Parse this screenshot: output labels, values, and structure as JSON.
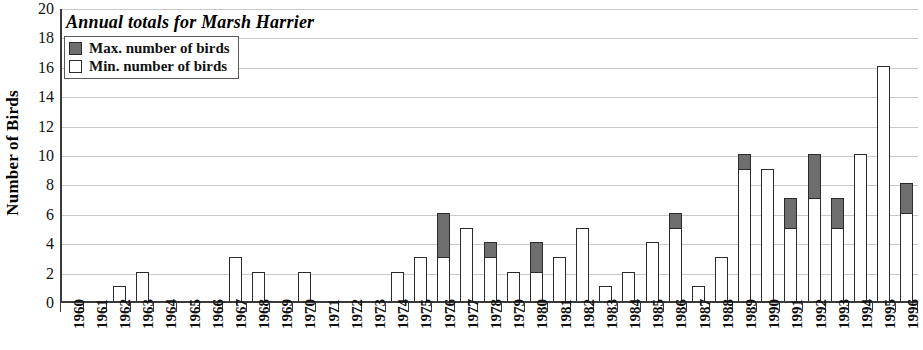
{
  "chart_data": {
    "type": "bar",
    "title": "Annual totals for Marsh Harrier",
    "xlabel": "",
    "ylabel": "Number of Birds",
    "ylim": [
      0,
      20
    ],
    "ytick_step": 2,
    "yticks": [
      20,
      18,
      16,
      14,
      12,
      10,
      8,
      6,
      4,
      2,
      0
    ],
    "grid": true,
    "stacked": true,
    "legend_position": "top-left",
    "legend": [
      {
        "label": "Max. number of birds",
        "color": "#6e6e6e"
      },
      {
        "label": "Min. number of birds",
        "color": "#ffffff"
      }
    ],
    "categories": [
      "1960",
      "1961",
      "1962",
      "1963",
      "1964",
      "1965",
      "1966",
      "1967",
      "1968",
      "1969",
      "1970",
      "1971",
      "1972",
      "1973",
      "1974",
      "1975",
      "1976",
      "1977",
      "1978",
      "1979",
      "1980",
      "1981",
      "1982",
      "1983",
      "1984",
      "1985",
      "1986",
      "1987",
      "1988",
      "1989",
      "1990",
      "1991",
      "1992",
      "1993",
      "1994",
      "1995",
      "1996"
    ],
    "series": [
      {
        "name": "Min. number of birds",
        "color": "#ffffff",
        "values": [
          0,
          0,
          1,
          2,
          0,
          0,
          0,
          3,
          2,
          0,
          2,
          0,
          0,
          0,
          2,
          3,
          3,
          5,
          3,
          2,
          2,
          3,
          5,
          1,
          2,
          4,
          5,
          1,
          3,
          9,
          9,
          5,
          7,
          5,
          10,
          16,
          6
        ]
      },
      {
        "name": "Max. number of birds",
        "color": "#6e6e6e",
        "values": [
          0,
          0,
          1,
          2,
          0,
          0,
          0,
          3,
          2,
          0,
          2,
          0,
          0,
          0,
          2,
          3,
          6,
          5,
          4,
          2,
          4,
          3,
          5,
          1,
          2,
          4,
          6,
          1,
          3,
          10,
          9,
          7,
          10,
          7,
          10,
          16,
          8
        ]
      }
    ]
  }
}
